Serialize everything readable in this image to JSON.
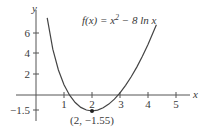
{
  "chart_data": {
    "type": "line",
    "title": "",
    "function_label": "f(x) = x² − 8 ln x",
    "function_parts": {
      "prefix": "f(x) = x",
      "exponent": "2",
      "suffix": " − 8 ln x"
    },
    "xlabel": "x",
    "ylabel": "y",
    "x_ticks": [
      "1",
      "2",
      "3",
      "4",
      "5"
    ],
    "y_ticks": [
      "6",
      "4",
      "2",
      "−1.5"
    ],
    "xlim": [
      -1.0,
      5.6
    ],
    "ylim": [
      -2.5,
      8.5
    ],
    "grid": false,
    "legend": null,
    "series": [
      {
        "name": "f(x) = x² − 8 ln x",
        "x": [
          0.4,
          0.6,
          0.8,
          1.0,
          1.2,
          1.4,
          1.6,
          1.8,
          2.0,
          2.2,
          2.4,
          2.6,
          2.8,
          3.0,
          3.2,
          3.4,
          3.6,
          3.8,
          4.0,
          4.3
        ],
        "y": [
          7.49,
          4.45,
          2.43,
          1.0,
          -0.02,
          -0.73,
          -1.2,
          -1.46,
          -1.55,
          -1.47,
          -1.24,
          -0.88,
          -0.4,
          0.21,
          0.94,
          1.77,
          2.71,
          3.76,
          4.91,
          6.82
        ]
      }
    ],
    "annotations": [
      {
        "label": "(2, −1.55)",
        "x": 2,
        "y": -1.55,
        "marker": "point"
      }
    ]
  }
}
